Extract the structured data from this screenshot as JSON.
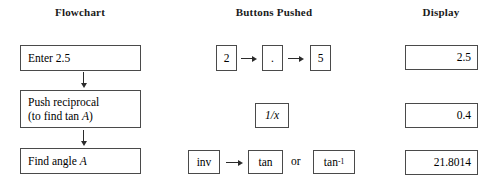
{
  "headers": {
    "flowchart": "Flowchart",
    "buttons": "Buttons Pushed",
    "display": "Display"
  },
  "flowchart": {
    "steps": [
      {
        "line1": "Enter 2.5",
        "line2": ""
      },
      {
        "line1": "Push reciprocal",
        "line2": "(to find tan A)"
      },
      {
        "line1": "Find angle A",
        "line2": ""
      }
    ],
    "variable": "A"
  },
  "buttons": {
    "row1": [
      {
        "label": "2"
      },
      {
        "label": "."
      },
      {
        "label": "5"
      }
    ],
    "row2": [
      {
        "label": "1/x"
      }
    ],
    "row3": [
      {
        "label": "inv"
      },
      {
        "label": "tan"
      },
      {
        "label": "tan",
        "exponent": "-1"
      }
    ],
    "connector_or": "or",
    "arrow_glyph": "arrow-right"
  },
  "display": {
    "values": [
      "2.5",
      "0.4",
      "21.8014"
    ]
  },
  "colors": {
    "border": "#4a4a4a",
    "text": "#000000",
    "arrow": "#2b2b2b",
    "background": "#ffffff"
  }
}
